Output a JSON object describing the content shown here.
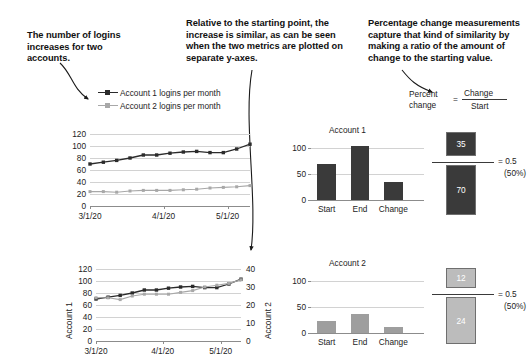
{
  "annotations": {
    "left": "The number of logins increases for two accounts.",
    "middle": "Relative to the starting point, the increase is similar, as can be seen when the two metrics are plotted on separate y-axes.",
    "right": "Percentage change measurements capture that kind of similarity by making a ratio of the amount of change to the starting value."
  },
  "formula": {
    "label_line1": "Percent",
    "label_line2": "change",
    "equals": "=",
    "numerator": "Change",
    "denominator": "Start"
  },
  "legend": {
    "items": [
      {
        "label": "Account 1 logins per month",
        "color": "#2b2b2b"
      },
      {
        "label": "Account 2 logins per month",
        "color": "#a8a8a8"
      }
    ]
  },
  "colors": {
    "account1": "#2b2b2b",
    "account2": "#a8a8a8",
    "grid": "#d2d2d2",
    "axis": "#8c8c8c",
    "box_dark": "#3a3a3a",
    "box_light": "#bcbcbc"
  },
  "chart_data": [
    {
      "id": "line-chart-shared-axis",
      "type": "line",
      "title": "",
      "xlabel": "",
      "ylabel": "",
      "ylim": [
        0,
        120
      ],
      "yticks": [
        0,
        20,
        40,
        60,
        80,
        100,
        120
      ],
      "xticks": [
        "3/1/20",
        "4/1/20",
        "5/1/20"
      ],
      "grid": true,
      "legend": "above",
      "x": [
        0,
        1,
        2,
        3,
        4,
        5,
        6,
        7,
        8,
        9,
        10,
        11,
        12
      ],
      "series": [
        {
          "name": "Account 1 logins per month",
          "color": "#2b2b2b",
          "values": [
            70,
            73,
            76,
            80,
            85,
            85,
            88,
            90,
            91,
            89,
            89,
            95,
            103
          ]
        },
        {
          "name": "Account 2 logins per month",
          "color": "#a8a8a8",
          "values": [
            24,
            24,
            23,
            25,
            26,
            26,
            26,
            27,
            28,
            30,
            31,
            32,
            34
          ]
        }
      ]
    },
    {
      "id": "line-chart-dual-axis",
      "type": "line",
      "title": "",
      "xlabel": "",
      "ylabel_left": "Account 1",
      "ylabel_right": "Account 2",
      "ylim_left": [
        0,
        120
      ],
      "ylim_right": [
        0,
        40
      ],
      "yticks_left": [
        0,
        20,
        40,
        60,
        80,
        100,
        120
      ],
      "yticks_right": [
        0,
        10,
        20,
        30,
        40
      ],
      "xticks": [
        "3/1/20",
        "4/1/20",
        "5/1/20"
      ],
      "grid": true,
      "x": [
        0,
        1,
        2,
        3,
        4,
        5,
        6,
        7,
        8,
        9,
        10,
        11,
        12
      ],
      "series": [
        {
          "name": "Account 1",
          "axis": "left",
          "color": "#2b2b2b",
          "values": [
            70,
            73,
            76,
            80,
            85,
            85,
            88,
            90,
            91,
            89,
            89,
            95,
            103
          ]
        },
        {
          "name": "Account 2",
          "axis": "right",
          "color": "#a8a8a8",
          "values": [
            24,
            24,
            23,
            25,
            26,
            26,
            26,
            27,
            28,
            30,
            31,
            32,
            34
          ]
        }
      ]
    },
    {
      "id": "bar-chart-account-1",
      "type": "bar",
      "title": "Account 1",
      "categories": [
        "Start",
        "End",
        "Change"
      ],
      "values": [
        70,
        105,
        35
      ],
      "ylim": [
        0,
        120
      ],
      "yticks": [
        0,
        50,
        100
      ],
      "color": "#3a3a3a",
      "xlabel": "",
      "ylabel": ""
    },
    {
      "id": "bar-chart-account-2",
      "type": "bar",
      "title": "Account 2",
      "categories": [
        "Start",
        "End",
        "Change"
      ],
      "values": [
        24,
        36,
        12
      ],
      "ylim": [
        0,
        120
      ],
      "yticks": [
        0,
        50,
        100
      ],
      "color": "#9e9e9e",
      "xlabel": "",
      "ylabel": ""
    }
  ],
  "ratios": [
    {
      "id": "ratio-account-1",
      "numerator": "35",
      "denominator": "70",
      "equals": "= 0.5",
      "percent": "(50%)",
      "style": "dark"
    },
    {
      "id": "ratio-account-2",
      "numerator": "12",
      "denominator": "24",
      "equals": "= 0.5",
      "percent": "(50%)",
      "style": "light"
    }
  ]
}
